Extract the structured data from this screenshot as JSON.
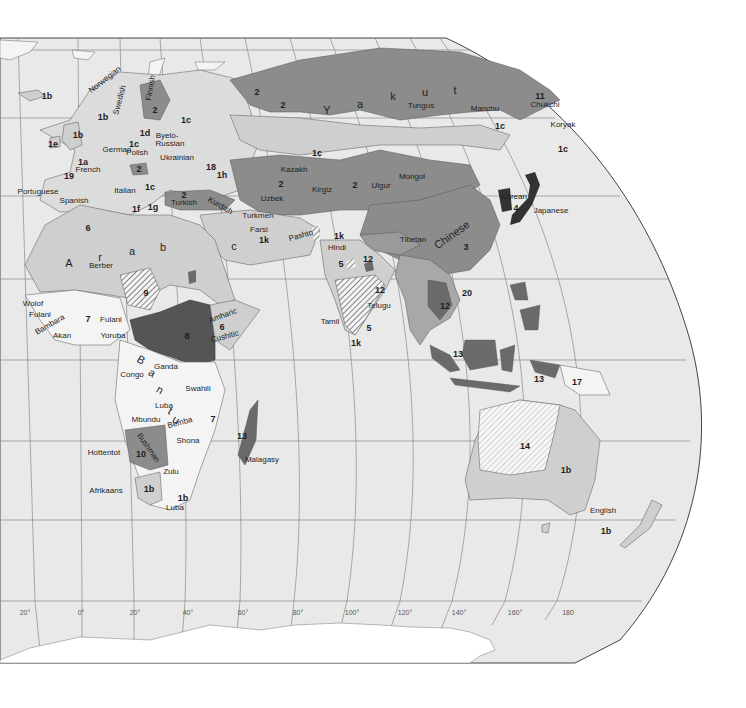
{
  "map": {
    "title": "World languages (Eastern Hemisphere)",
    "colors": {
      "ocean": "#e9e9e9",
      "land_light": "#f4f4f4",
      "family_1": "#cfcfcf",
      "family_2": "#8c8c8c",
      "family_dark": "#6a6a6a",
      "family_darkest": "#333333",
      "graticule": "#8a8a8a",
      "border": "#555555"
    },
    "longitude_ticks": [
      "20°",
      "0°",
      "20°",
      "40°",
      "60°",
      "80°",
      "100°",
      "120°",
      "140°",
      "160°",
      "180"
    ],
    "labels": [
      {
        "text": "1b",
        "x": 47,
        "y": 96,
        "kind": "code"
      },
      {
        "text": "Norwegian",
        "x": 105,
        "y": 80,
        "kind": "lang",
        "rot": -38
      },
      {
        "text": "Swedish",
        "x": 120,
        "y": 100,
        "kind": "lang",
        "rot": -75
      },
      {
        "text": "Finnish",
        "x": 151,
        "y": 88,
        "kind": "lang",
        "rot": -80
      },
      {
        "text": "2",
        "x": 155,
        "y": 110,
        "kind": "code"
      },
      {
        "text": "1b",
        "x": 103,
        "y": 117,
        "kind": "code"
      },
      {
        "text": "1c",
        "x": 186,
        "y": 120,
        "kind": "code"
      },
      {
        "text": "1b",
        "x": 78,
        "y": 135,
        "kind": "code"
      },
      {
        "text": "1d",
        "x": 145,
        "y": 133,
        "kind": "code"
      },
      {
        "text": "Byelo-",
        "x": 167,
        "y": 136,
        "kind": "lang"
      },
      {
        "text": "Russian",
        "x": 170,
        "y": 144,
        "kind": "lang"
      },
      {
        "text": "1e",
        "x": 53,
        "y": 144,
        "kind": "code"
      },
      {
        "text": "1c",
        "x": 134,
        "y": 144,
        "kind": "code"
      },
      {
        "text": "German",
        "x": 117,
        "y": 150,
        "kind": "lang"
      },
      {
        "text": "Polish",
        "x": 137,
        "y": 153,
        "kind": "lang"
      },
      {
        "text": "Ukrainian",
        "x": 177,
        "y": 158,
        "kind": "lang"
      },
      {
        "text": "1a",
        "x": 83,
        "y": 162,
        "kind": "code"
      },
      {
        "text": "2",
        "x": 139,
        "y": 169,
        "kind": "code"
      },
      {
        "text": "French",
        "x": 88,
        "y": 170,
        "kind": "lang"
      },
      {
        "text": "18",
        "x": 211,
        "y": 167,
        "kind": "code"
      },
      {
        "text": "1h",
        "x": 222,
        "y": 175,
        "kind": "code"
      },
      {
        "text": "19",
        "x": 69,
        "y": 176,
        "kind": "code"
      },
      {
        "text": "Portuguese",
        "x": 38,
        "y": 192,
        "kind": "lang"
      },
      {
        "text": "Italian",
        "x": 125,
        "y": 191,
        "kind": "lang"
      },
      {
        "text": "1c",
        "x": 150,
        "y": 187,
        "kind": "code"
      },
      {
        "text": "2",
        "x": 184,
        "y": 195,
        "kind": "code"
      },
      {
        "text": "Spanish",
        "x": 74,
        "y": 201,
        "kind": "lang"
      },
      {
        "text": "Turkish",
        "x": 184,
        "y": 203,
        "kind": "lang"
      },
      {
        "text": "Kurdish",
        "x": 220,
        "y": 206,
        "kind": "lang",
        "rot": 30
      },
      {
        "text": "1f",
        "x": 136,
        "y": 209,
        "kind": "code"
      },
      {
        "text": "1g",
        "x": 153,
        "y": 207,
        "kind": "code"
      },
      {
        "text": "2",
        "x": 257,
        "y": 92,
        "kind": "code"
      },
      {
        "text": "2",
        "x": 283,
        "y": 105,
        "kind": "code"
      },
      {
        "text": "Y",
        "x": 327,
        "y": 110,
        "kind": "big"
      },
      {
        "text": "a",
        "x": 360,
        "y": 104,
        "kind": "big"
      },
      {
        "text": "k",
        "x": 393,
        "y": 96,
        "kind": "big"
      },
      {
        "text": "u",
        "x": 425,
        "y": 92,
        "kind": "big"
      },
      {
        "text": "t",
        "x": 455,
        "y": 90,
        "kind": "big"
      },
      {
        "text": "Tungus",
        "x": 421,
        "y": 106,
        "kind": "lang"
      },
      {
        "text": "Manchu",
        "x": 485,
        "y": 109,
        "kind": "lang"
      },
      {
        "text": "11",
        "x": 540,
        "y": 96,
        "kind": "code"
      },
      {
        "text": "Chukchi",
        "x": 545,
        "y": 105,
        "kind": "lang"
      },
      {
        "text": "Koryak",
        "x": 563,
        "y": 125,
        "kind": "lang"
      },
      {
        "text": "1c",
        "x": 500,
        "y": 126,
        "kind": "code"
      },
      {
        "text": "1c",
        "x": 563,
        "y": 149,
        "kind": "code"
      },
      {
        "text": "1c",
        "x": 317,
        "y": 153,
        "kind": "code"
      },
      {
        "text": "Kazakh",
        "x": 294,
        "y": 170,
        "kind": "lang"
      },
      {
        "text": "2",
        "x": 281,
        "y": 184,
        "kind": "code"
      },
      {
        "text": "2",
        "x": 355,
        "y": 185,
        "kind": "code"
      },
      {
        "text": "Uigur",
        "x": 381,
        "y": 186,
        "kind": "lang"
      },
      {
        "text": "Mongol",
        "x": 412,
        "y": 177,
        "kind": "lang"
      },
      {
        "text": "Kirgiz",
        "x": 322,
        "y": 190,
        "kind": "lang"
      },
      {
        "text": "Uzbek",
        "x": 272,
        "y": 199,
        "kind": "lang"
      },
      {
        "text": "Korean",
        "x": 514,
        "y": 197,
        "kind": "lang"
      },
      {
        "text": "4",
        "x": 516,
        "y": 208,
        "kind": "code"
      },
      {
        "text": "Japanese",
        "x": 551,
        "y": 211,
        "kind": "lang"
      },
      {
        "text": "Turkmen",
        "x": 258,
        "y": 216,
        "kind": "lang"
      },
      {
        "text": "Pashto",
        "x": 301,
        "y": 236,
        "kind": "lang",
        "rot": -15
      },
      {
        "text": "Farsi",
        "x": 259,
        "y": 230,
        "kind": "lang"
      },
      {
        "text": "1k",
        "x": 264,
        "y": 240,
        "kind": "code"
      },
      {
        "text": "1k",
        "x": 339,
        "y": 236,
        "kind": "code"
      },
      {
        "text": "Tibetan",
        "x": 413,
        "y": 240,
        "kind": "lang"
      },
      {
        "text": "Chinese",
        "x": 452,
        "y": 235,
        "kind": "big",
        "rot": -35
      },
      {
        "text": "3",
        "x": 466,
        "y": 247,
        "kind": "code"
      },
      {
        "text": "Hindi",
        "x": 337,
        "y": 248,
        "kind": "lang"
      },
      {
        "text": "c",
        "x": 234,
        "y": 246,
        "kind": "big"
      },
      {
        "text": "6",
        "x": 88,
        "y": 228,
        "kind": "code"
      },
      {
        "text": "a",
        "x": 132,
        "y": 251,
        "kind": "big"
      },
      {
        "text": "b",
        "x": 163,
        "y": 247,
        "kind": "big"
      },
      {
        "text": "A",
        "x": 69,
        "y": 263,
        "kind": "big"
      },
      {
        "text": "r",
        "x": 100,
        "y": 257,
        "kind": "big"
      },
      {
        "text": "Berber",
        "x": 101,
        "y": 266,
        "kind": "lang"
      },
      {
        "text": "5",
        "x": 341,
        "y": 264,
        "kind": "code"
      },
      {
        "text": "12",
        "x": 368,
        "y": 259,
        "kind": "code"
      },
      {
        "text": "12",
        "x": 380,
        "y": 290,
        "kind": "code"
      },
      {
        "text": "9",
        "x": 146,
        "y": 293,
        "kind": "code"
      },
      {
        "text": "20",
        "x": 467,
        "y": 293,
        "kind": "code"
      },
      {
        "text": "12",
        "x": 445,
        "y": 306,
        "kind": "code"
      },
      {
        "text": "Telugu",
        "x": 379,
        "y": 306,
        "kind": "lang"
      },
      {
        "text": "Wolof",
        "x": 33,
        "y": 304,
        "kind": "lang"
      },
      {
        "text": "Fulani",
        "x": 40,
        "y": 315,
        "kind": "lang"
      },
      {
        "text": "Bambara",
        "x": 50,
        "y": 325,
        "kind": "lang",
        "rot": -30
      },
      {
        "text": "7",
        "x": 88,
        "y": 319,
        "kind": "code"
      },
      {
        "text": "Fulani",
        "x": 111,
        "y": 320,
        "kind": "lang"
      },
      {
        "text": "Amharic",
        "x": 223,
        "y": 316,
        "kind": "lang",
        "rot": -20
      },
      {
        "text": "6",
        "x": 222,
        "y": 327,
        "kind": "code"
      },
      {
        "text": "Tamil",
        "x": 330,
        "y": 322,
        "kind": "lang"
      },
      {
        "text": "5",
        "x": 369,
        "y": 328,
        "kind": "code"
      },
      {
        "text": "Cushitic",
        "x": 225,
        "y": 337,
        "kind": "lang",
        "rot": -15
      },
      {
        "text": "Akan",
        "x": 62,
        "y": 336,
        "kind": "lang"
      },
      {
        "text": "Yoruba",
        "x": 113,
        "y": 336,
        "kind": "lang"
      },
      {
        "text": "8",
        "x": 187,
        "y": 336,
        "kind": "code"
      },
      {
        "text": "1k",
        "x": 356,
        "y": 343,
        "kind": "code"
      },
      {
        "text": "13",
        "x": 458,
        "y": 354,
        "kind": "code"
      },
      {
        "text": "B",
        "x": 141,
        "y": 360,
        "kind": "big",
        "rot": 30
      },
      {
        "text": "Congo",
        "x": 132,
        "y": 375,
        "kind": "lang"
      },
      {
        "text": "a",
        "x": 152,
        "y": 373,
        "kind": "big",
        "rot": 30
      },
      {
        "text": "Ganda",
        "x": 166,
        "y": 367,
        "kind": "lang"
      },
      {
        "text": "Swahili",
        "x": 198,
        "y": 389,
        "kind": "lang"
      },
      {
        "text": "n",
        "x": 160,
        "y": 390,
        "kind": "big",
        "rot": 30
      },
      {
        "text": "13",
        "x": 539,
        "y": 379,
        "kind": "code"
      },
      {
        "text": "17",
        "x": 577,
        "y": 382,
        "kind": "code"
      },
      {
        "text": "Luba",
        "x": 164,
        "y": 406,
        "kind": "lang"
      },
      {
        "text": "t",
        "x": 170,
        "y": 411,
        "kind": "big",
        "rot": 30
      },
      {
        "text": "u",
        "x": 176,
        "y": 420,
        "kind": "big",
        "rot": 30
      },
      {
        "text": "Mbundu",
        "x": 146,
        "y": 420,
        "kind": "lang"
      },
      {
        "text": "Bemba",
        "x": 180,
        "y": 423,
        "kind": "lang",
        "rot": -15
      },
      {
        "text": "7",
        "x": 213,
        "y": 419,
        "kind": "code"
      },
      {
        "text": "13",
        "x": 242,
        "y": 436,
        "kind": "code"
      },
      {
        "text": "Shona",
        "x": 188,
        "y": 441,
        "kind": "lang"
      },
      {
        "text": "Bushman",
        "x": 148,
        "y": 448,
        "kind": "lang",
        "rot": 55
      },
      {
        "text": "10",
        "x": 141,
        "y": 454,
        "kind": "code"
      },
      {
        "text": "Hottentot",
        "x": 104,
        "y": 453,
        "kind": "lang"
      },
      {
        "text": "14",
        "x": 525,
        "y": 446,
        "kind": "code"
      },
      {
        "text": "Malagasy",
        "x": 262,
        "y": 460,
        "kind": "lang"
      },
      {
        "text": "Zulu",
        "x": 171,
        "y": 472,
        "kind": "lang"
      },
      {
        "text": "1b",
        "x": 566,
        "y": 470,
        "kind": "code"
      },
      {
        "text": "1b",
        "x": 149,
        "y": 489,
        "kind": "code"
      },
      {
        "text": "Afrikaans",
        "x": 106,
        "y": 491,
        "kind": "lang"
      },
      {
        "text": "1b",
        "x": 183,
        "y": 498,
        "kind": "code"
      },
      {
        "text": "Luba",
        "x": 175,
        "y": 508,
        "kind": "lang"
      },
      {
        "text": "English",
        "x": 603,
        "y": 511,
        "kind": "lang"
      },
      {
        "text": "1b",
        "x": 606,
        "y": 531,
        "kind": "code"
      }
    ]
  }
}
